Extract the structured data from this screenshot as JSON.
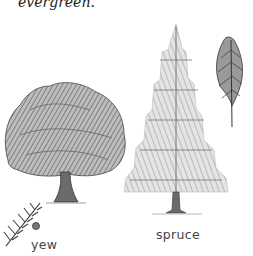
{
  "text": {
    "top_fragment": "evergreen."
  },
  "figures": [
    {
      "id": "yew",
      "label": "yew",
      "parts": [
        "tree",
        "sprig-with-berry"
      ]
    },
    {
      "id": "spruce",
      "label": "spruce",
      "parts": [
        "tree",
        "shoot"
      ]
    }
  ],
  "colors": {
    "ink": "#333333",
    "foliage_dark": "#555555",
    "foliage_light": "#999999",
    "background": "#ffffff"
  }
}
